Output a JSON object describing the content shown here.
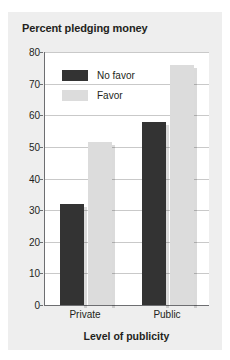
{
  "chart_data": {
    "type": "bar",
    "title": "Percent pledging money",
    "xlabel": "Level of publicity",
    "ylabel": "",
    "categories": [
      "Private",
      "Public"
    ],
    "series": [
      {
        "name": "No favor",
        "values": [
          32,
          58
        ],
        "color": "#333333"
      },
      {
        "name": "Favor",
        "values": [
          51.5,
          76
        ],
        "color": "#dcdcdc"
      }
    ],
    "ylim": [
      0,
      80
    ],
    "yticks": [
      0,
      10,
      20,
      30,
      40,
      50,
      60,
      70,
      80
    ],
    "ytick_labels": [
      "0",
      "10",
      "20",
      "30",
      "40",
      "50",
      "60",
      "70",
      "80"
    ],
    "grid": true,
    "legend_position": "upper left"
  },
  "legend": {
    "items": [
      {
        "label": "No favor",
        "swatch": "dark-swatch"
      },
      {
        "label": "Favor",
        "swatch": "light-swatch"
      }
    ]
  }
}
